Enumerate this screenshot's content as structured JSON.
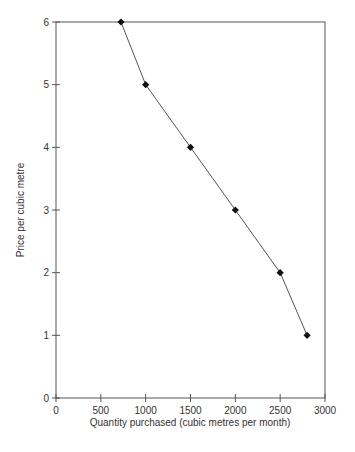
{
  "chart_data": {
    "type": "line",
    "title": "",
    "xlabel": "Quantity purchased (cubic metres per month)",
    "ylabel": "Price per cubic metre",
    "xlim": [
      0,
      3000
    ],
    "ylim": [
      0,
      6
    ],
    "x_ticks": [
      0,
      500,
      1000,
      1500,
      2000,
      2500,
      3000
    ],
    "y_ticks": [
      0,
      1,
      2,
      3,
      4,
      5,
      6
    ],
    "grid": false,
    "legend": null,
    "marker": "diamond",
    "series": [
      {
        "name": "Demand",
        "x": [
          725,
          1000,
          1500,
          2000,
          2500,
          2800
        ],
        "y": [
          6,
          5,
          4,
          3,
          2,
          1
        ]
      }
    ]
  },
  "colors": {
    "axis": "#555555",
    "line": "#555555",
    "marker": "#111111"
  }
}
